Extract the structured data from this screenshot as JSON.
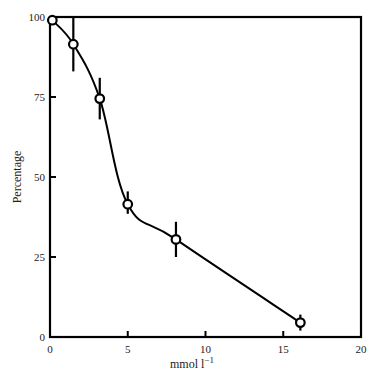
{
  "chart_data": {
    "type": "line",
    "title": "",
    "xlabel": "mmol l⁻¹",
    "ylabel": "Percentage",
    "xlim": [
      0,
      20
    ],
    "ylim": [
      0,
      100
    ],
    "x_ticks": [
      0,
      5,
      10,
      15,
      20
    ],
    "y_ticks": [
      0,
      25,
      50,
      75,
      100
    ],
    "grid": false,
    "legend": null,
    "series": [
      {
        "name": "Percentage",
        "marker": "open-circle",
        "smooth": true,
        "x": [
          0.15,
          1.5,
          3.2,
          5.0,
          8.1,
          16.1
        ],
        "values": [
          99,
          91.5,
          74.5,
          41.5,
          30.5,
          4.5
        ],
        "error_low": [
          null,
          83,
          68,
          38.5,
          25,
          2
        ],
        "error_high": [
          null,
          100,
          81,
          45.5,
          36,
          7
        ]
      }
    ]
  },
  "axes": {
    "xlabel_main": "mmol l",
    "xlabel_sup": "−1",
    "ylabel": "Percentage"
  }
}
